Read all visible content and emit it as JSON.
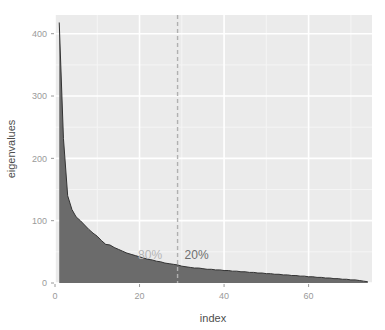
{
  "chart_data": {
    "type": "area",
    "title": "",
    "xlabel": "index",
    "ylabel": "eigenvalues",
    "xlim": [
      0,
      75
    ],
    "ylim": [
      0,
      430
    ],
    "grid": true,
    "legend": "none",
    "xticks": [
      0,
      20,
      40,
      60
    ],
    "xtick_labels": [
      "0",
      "20",
      "40",
      "60"
    ],
    "yticks": [
      0,
      100,
      200,
      300,
      400
    ],
    "ytick_labels": [
      "0",
      "100",
      "200",
      "300",
      "400"
    ],
    "x": [
      1,
      2,
      3,
      4,
      5,
      6,
      7,
      8,
      9,
      10,
      11,
      12,
      13,
      14,
      15,
      16,
      17,
      18,
      19,
      20,
      21,
      22,
      23,
      24,
      25,
      26,
      27,
      28,
      29,
      30,
      31,
      32,
      33,
      34,
      35,
      36,
      37,
      38,
      39,
      40,
      41,
      42,
      43,
      44,
      45,
      46,
      47,
      48,
      49,
      50,
      51,
      52,
      53,
      54,
      55,
      56,
      57,
      58,
      59,
      60,
      61,
      62,
      63,
      64,
      65,
      66,
      67,
      68,
      69,
      70,
      71,
      72,
      73,
      74
    ],
    "values": [
      418,
      232,
      140,
      118,
      106,
      100,
      93,
      86,
      80,
      75,
      68,
      62,
      61,
      57,
      54,
      51,
      48,
      46,
      44,
      42,
      40,
      38,
      37,
      35,
      34,
      32,
      31,
      30,
      29,
      27,
      26,
      25,
      24,
      24,
      23,
      22,
      22,
      21,
      21,
      20,
      20,
      19,
      19,
      18,
      18,
      17,
      17,
      16,
      16,
      15,
      15,
      14,
      14,
      13,
      13,
      12,
      12,
      11,
      11,
      10,
      10,
      9,
      9,
      8,
      8,
      7,
      7,
      6,
      6,
      5,
      5,
      4,
      3,
      2
    ],
    "annotations": [
      {
        "name": "cumulative-variance-left",
        "label": "80%",
        "x": 22.5,
        "y": 38,
        "color": "#b5b5b5"
      },
      {
        "name": "cumulative-variance-right",
        "label": "20%",
        "x": 33.5,
        "y": 38,
        "color": "#6e6e6e"
      }
    ],
    "vline": {
      "name": "split-line",
      "x": 29,
      "style": "dashed",
      "color": "#b0b0b0"
    },
    "colors": {
      "panel_background": "#ebebeb",
      "grid_major": "#ffffff",
      "grid_minor": "#f5f5f5",
      "area_fill": "#6b6b6b",
      "curve_line": "#333333",
      "axis_text": "#9a9a9a",
      "axis_title": "#4d4d4d",
      "page_background": "#ffffff"
    }
  },
  "labels": {
    "x_axis_title": "index",
    "y_axis_title": "eigenvalues"
  }
}
